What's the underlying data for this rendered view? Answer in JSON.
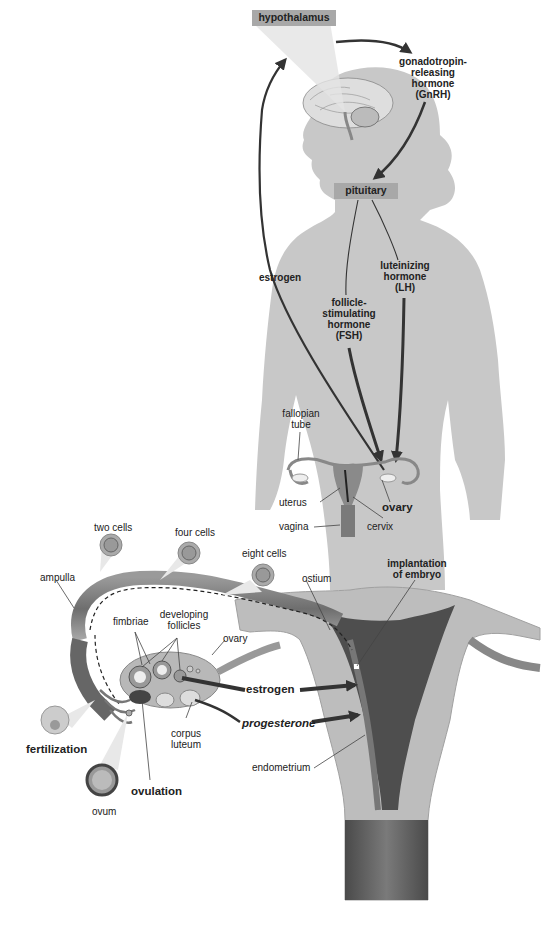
{
  "diagram": {
    "colors": {
      "background": "#ffffff",
      "body_silhouette": "#c8c8c8",
      "label_box": "#a8a8a8",
      "arrow": "#3a3a3a",
      "tissue_dark": "#5a5a5a",
      "tissue_light": "#bdbdbd"
    },
    "boxes": {
      "hypothalamus": "hypothalamus",
      "pituitary": "pituitary"
    },
    "hormones": {
      "gnrh": [
        "gonadotropin-",
        "releasing",
        "hormone",
        "(GnRH)"
      ],
      "estrogen_top": "estrogen",
      "fsh": [
        "follicle-",
        "stimulating",
        "hormone",
        "(FSH)"
      ],
      "lh": [
        "luteinizing",
        "hormone",
        "(LH)"
      ],
      "estrogen_bottom": "estrogen",
      "progesterone": "progesterone"
    },
    "anatomy_small": {
      "fallopian_tube": [
        "fallopian",
        "tube"
      ],
      "uterus": "uterus",
      "vagina": "vagina",
      "cervix": "cervix",
      "ovary": "ovary"
    },
    "anatomy_detail": {
      "two_cells": "two cells",
      "four_cells": "four cells",
      "eight_cells": "eight cells",
      "ampulla": "ampulla",
      "ostium": "ostium",
      "implantation": [
        "implantation",
        "of embryo"
      ],
      "fimbriae": "fimbriae",
      "developing_follicles": [
        "developing",
        "follicles"
      ],
      "ovary": "ovary",
      "corpus_luteum": [
        "corpus",
        "luteum"
      ],
      "endometrium": "endometrium",
      "fertilization": "fertilization",
      "ovulation": "ovulation",
      "ovum": "ovum"
    }
  }
}
